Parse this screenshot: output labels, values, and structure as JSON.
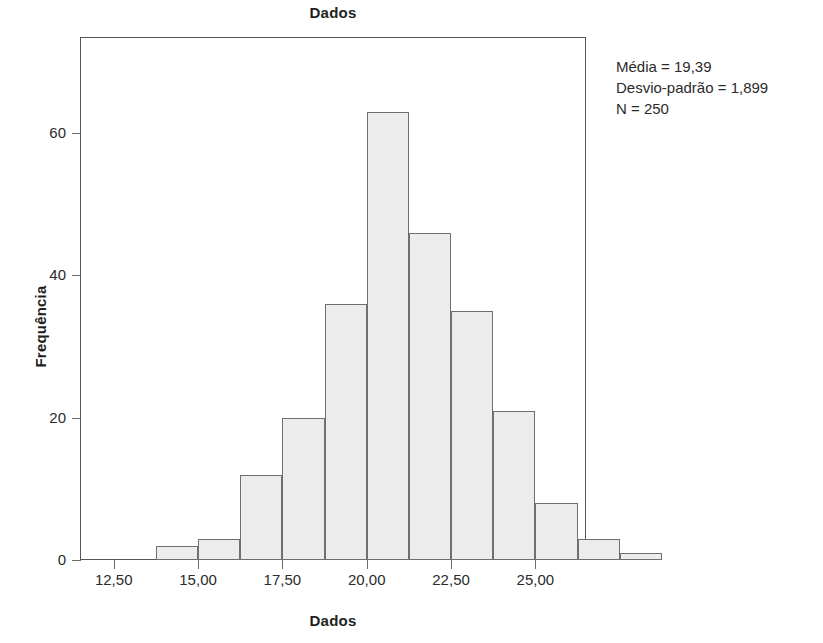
{
  "chart_data": {
    "type": "bar",
    "title": "Dados",
    "xlabel": "Dados",
    "ylabel": "Frequência",
    "categories": [
      "13,75",
      "15,00",
      "16,25",
      "17,50",
      "18,75",
      "20,00",
      "21,25",
      "22,50",
      "23,75",
      "25,00",
      "26,25",
      "27,50"
    ],
    "bin_centers": [
      14.375,
      15.625,
      16.875,
      18.125,
      19.375,
      20.625,
      21.875,
      23.125,
      24.375,
      25.625,
      26.875,
      28.125
    ],
    "bin_width": 1.25,
    "values": [
      2,
      3,
      12,
      20,
      36,
      63,
      46,
      35,
      21,
      8,
      3,
      1
    ],
    "xlim": [
      11.5,
      26.5
    ],
    "ylim": [
      0,
      73.5
    ],
    "xticks": [
      "12,50",
      "15,00",
      "17,50",
      "20,00",
      "22,50",
      "25,00"
    ],
    "xtick_values": [
      12.5,
      15.0,
      17.5,
      20.0,
      22.5,
      25.0
    ],
    "yticks": [
      "0",
      "20",
      "40",
      "60"
    ],
    "ytick_values": [
      0,
      20,
      40,
      60
    ],
    "grid": false,
    "legend": "none",
    "bar_fill_color": "#ececec",
    "bar_edge_color": "#6f6f6f",
    "frame_color": "#565656",
    "annotations": {
      "mean_line": "Média = 19,39",
      "sd_line": "Desvio-padrão = 1,899",
      "n_line": "N = 250"
    }
  },
  "stats": {
    "mean": "Média = 19,39",
    "sd": "Desvio-padrão = 1,899",
    "n": "N = 250"
  },
  "axes": {
    "title": "Dados",
    "x_title": "Dados",
    "y_title": "Frequência"
  }
}
